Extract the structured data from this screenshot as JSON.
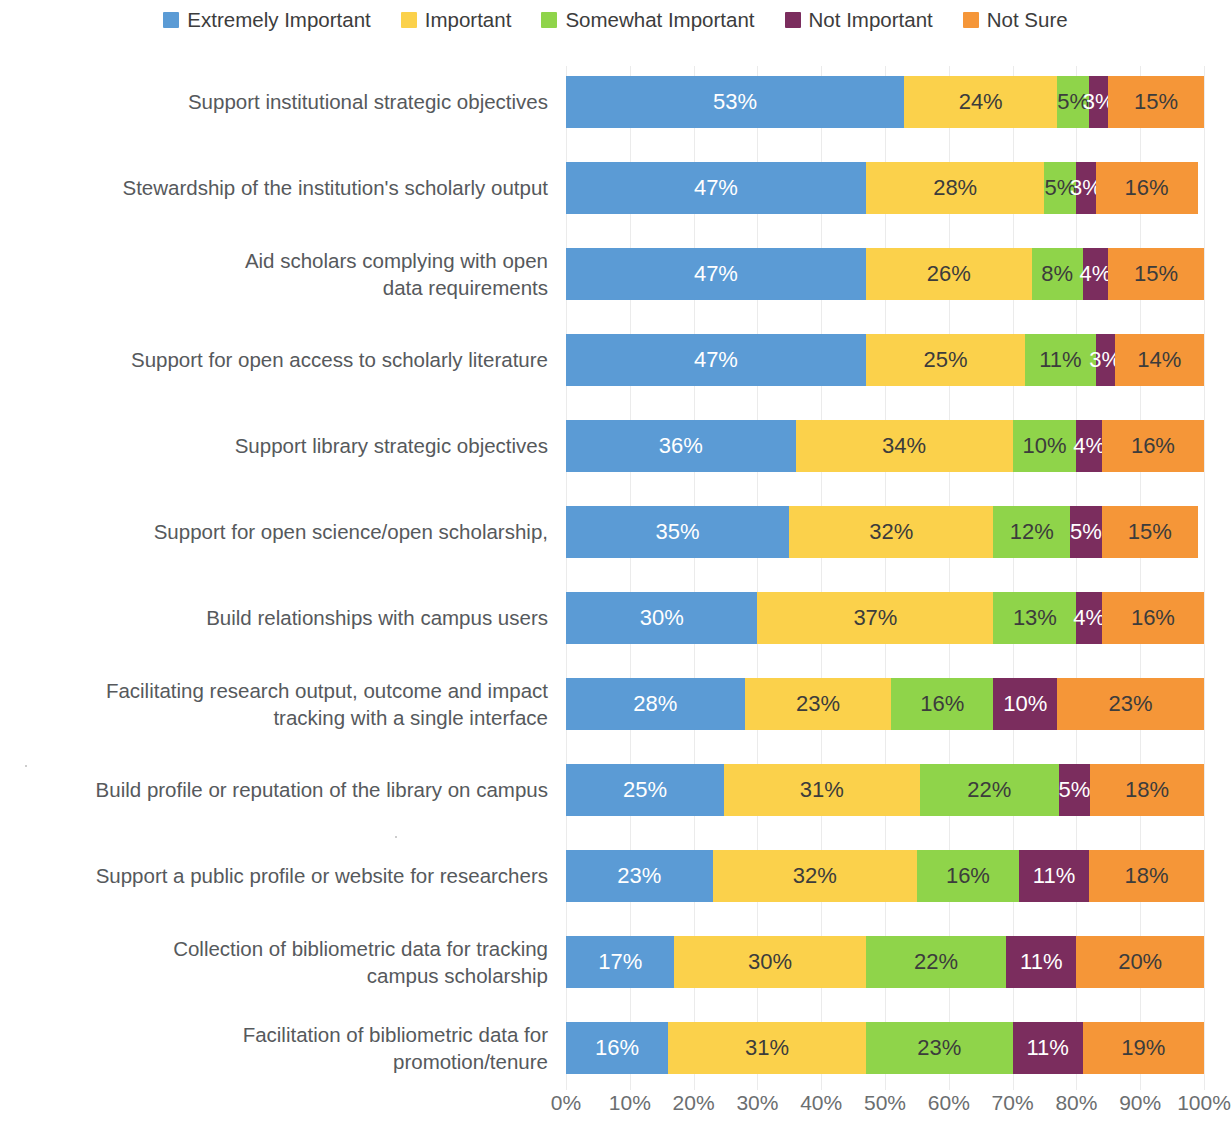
{
  "chart_data": {
    "type": "bar",
    "subtype": "horizontal-stacked-100",
    "title": "",
    "subtitle": "",
    "xlabel": "",
    "ylabel": "",
    "xlim": [
      0,
      100
    ],
    "xticks": [
      "0%",
      "10%",
      "20%",
      "30%",
      "40%",
      "50%",
      "60%",
      "70%",
      "80%",
      "90%",
      "100%"
    ],
    "grid": true,
    "legend_position": "top-center",
    "value_suffix": "%",
    "categories": [
      "Support institutional strategic objectives",
      "Stewardship of the institution's scholarly output",
      "Aid scholars complying with open data requirements",
      "Support for open access to scholarly literature",
      "Support library strategic objectives",
      "Support for open science/open scholarship,",
      "Build relationships with campus users",
      "Facilitating research output, outcome and impact tracking with a single interface",
      "Build profile or reputation of the library on campus",
      "Support a public profile or website for researchers",
      "Collection of bibliometric data for tracking campus scholarship",
      "Facilitation of bibliometric data for promotion/tenure"
    ],
    "category_lines": [
      [
        "Support institutional strategic objectives"
      ],
      [
        "Stewardship of the institution's scholarly output"
      ],
      [
        "Aid scholars complying with open",
        "data requirements"
      ],
      [
        "Support for open access to scholarly literature"
      ],
      [
        "Support library strategic objectives"
      ],
      [
        "Support for open science/open scholarship,"
      ],
      [
        "Build relationships with campus users"
      ],
      [
        "Facilitating research output, outcome and impact",
        "tracking with a single interface"
      ],
      [
        "Build profile or reputation of the library on campus"
      ],
      [
        "Support a public profile or website for researchers"
      ],
      [
        "Collection of bibliometric data for tracking",
        "campus scholarship"
      ],
      [
        "Facilitation of bibliometric data for",
        "promotion/tenure"
      ]
    ],
    "series": [
      {
        "name": "Extremely Important",
        "color": "#5b9bd5",
        "label_color": "#ffffff",
        "values": [
          53,
          47,
          47,
          47,
          36,
          35,
          30,
          28,
          25,
          23,
          17,
          16
        ],
        "labels": [
          "53%",
          "47%",
          "47%",
          "47%",
          "36%",
          "35%",
          "30%",
          "28%",
          "25%",
          "23%",
          "17%",
          "16%"
        ]
      },
      {
        "name": "Important",
        "color": "#fbd14b",
        "label_color": "#3c3c3c",
        "values": [
          24,
          28,
          26,
          25,
          34,
          32,
          37,
          23,
          31,
          32,
          30,
          31
        ],
        "labels": [
          "24%",
          "28%",
          "26%",
          "25%",
          "34%",
          "32%",
          "37%",
          "23%",
          "31%",
          "32%",
          "30%",
          "31%"
        ]
      },
      {
        "name": "Somewhat Important",
        "color": "#8fd44a",
        "label_color": "#3c3c3c",
        "values": [
          5,
          5,
          8,
          11,
          10,
          12,
          13,
          16,
          22,
          16,
          22,
          23
        ],
        "labels": [
          "5%",
          "5%",
          "8%",
          "11%",
          "10%",
          "12%",
          "13%",
          "16%",
          "22%",
          "16%",
          "22%",
          "23%"
        ]
      },
      {
        "name": "Not Important",
        "color": "#7b2d5e",
        "label_color": "#ffffff",
        "values": [
          3,
          3,
          4,
          3,
          4,
          5,
          4,
          10,
          5,
          11,
          11,
          11
        ],
        "labels": [
          "3%",
          "3%",
          "4%",
          "3%",
          "4%",
          "5%",
          "4%",
          "10%",
          "5%",
          "11%",
          "11%",
          "11%"
        ]
      },
      {
        "name": "Not Sure",
        "color": "#f59638",
        "label_color": "#3c3c3c",
        "values": [
          15,
          16,
          15,
          14,
          16,
          15,
          16,
          23,
          18,
          18,
          20,
          19
        ],
        "labels": [
          "15%",
          "16%",
          "15%",
          "14%",
          "16%",
          "15%",
          "16%",
          "23%",
          "18%",
          "18%",
          "20%",
          "19%"
        ]
      }
    ]
  },
  "legend": {
    "items": [
      {
        "label": "Extremely Important",
        "color": "#5b9bd5"
      },
      {
        "label": "Important",
        "color": "#fbd14b"
      },
      {
        "label": "Somewhat Important",
        "color": "#8fd44a"
      },
      {
        "label": "Not Important",
        "color": "#7b2d5e"
      },
      {
        "label": "Not Sure",
        "color": "#f59638"
      }
    ]
  }
}
